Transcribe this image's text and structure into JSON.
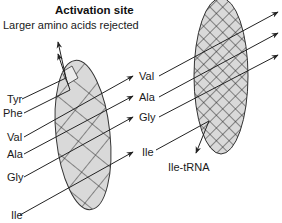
{
  "diagram": {
    "title": "Activation site",
    "subtitle": "Larger amino acids rejected",
    "activation_site": {
      "inputs": [
        {
          "label": "Tyr",
          "outcome": "rejected"
        },
        {
          "label": "Phe",
          "outcome": "rejected"
        },
        {
          "label": "Val",
          "outcome": "passes"
        },
        {
          "label": "Ala",
          "outcome": "passes"
        },
        {
          "label": "Gly",
          "outcome": "passes"
        },
        {
          "label": "Ile",
          "outcome": "passes"
        }
      ]
    },
    "editing_site": {
      "inputs": [
        {
          "label": "Val",
          "outcome": "passes"
        },
        {
          "label": "Ala",
          "outcome": "passes"
        },
        {
          "label": "Gly",
          "outcome": "passes"
        },
        {
          "label": "Ile",
          "outcome": "retained"
        }
      ],
      "product": "Ile-tRNA"
    },
    "colors": {
      "sieve_fill": "#d9d9d9",
      "stroke": "#222222",
      "text": "#1a1a1a"
    }
  }
}
